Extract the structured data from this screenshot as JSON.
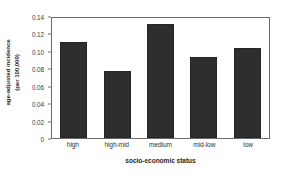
{
  "chart_data": {
    "type": "bar",
    "title": "",
    "categories": [
      "high",
      "high-mid",
      "medium",
      "mid-low",
      "low"
    ],
    "values": [
      0.11,
      0.077,
      0.131,
      0.093,
      0.103
    ],
    "xlabel": "socio-economic status",
    "ylabel_line1": "age-adjusted incidence",
    "ylabel_line2": "(per 100,000)",
    "ylim": [
      0,
      0.14
    ],
    "ytick_labels": [
      "0.14",
      "0.12",
      "0.10",
      "0.08",
      "0.06",
      "0.04",
      "0.02",
      "0"
    ],
    "ytick_values": [
      0.14,
      0.12,
      0.1,
      0.08,
      0.06,
      0.04,
      0.02,
      0
    ],
    "grid": false,
    "legend": false,
    "bar_color": "#2e2e2e",
    "axis_color": "#6b6b6b",
    "background": "#ffffff"
  }
}
